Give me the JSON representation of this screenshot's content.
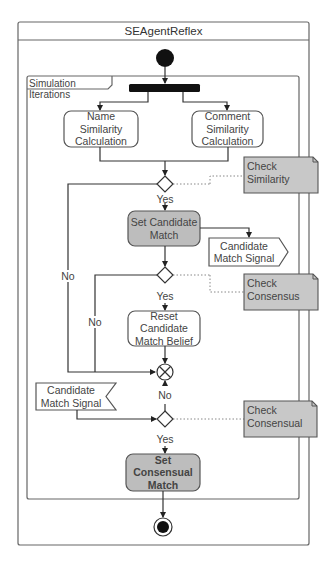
{
  "diagram": {
    "type": "uml-activity",
    "outer_frame": {
      "title": "SEAgentReflex"
    },
    "inner_frame": {
      "label": "Simulation Iterations"
    },
    "nodes": {
      "initial": {
        "kind": "initial"
      },
      "fork": {
        "kind": "fork"
      },
      "name_similarity": {
        "kind": "action",
        "label": "Name Similarity Calculation"
      },
      "comment_similarity": {
        "kind": "action",
        "label": "Comment Similarity Calculation"
      },
      "decision_similarity": {
        "kind": "decision"
      },
      "set_candidate_match": {
        "kind": "action",
        "label": "Set Candidate Match",
        "fill": "#bdbdbd"
      },
      "send_signal": {
        "kind": "send-signal",
        "label": "Candidate Match Signal"
      },
      "decision_consensus": {
        "kind": "decision"
      },
      "reset_candidate": {
        "kind": "action",
        "label": "Reset Candidate Match Belief"
      },
      "merge": {
        "kind": "merge"
      },
      "accept_signal": {
        "kind": "accept-signal",
        "label": "Candidate Match Signal"
      },
      "decision_consensual": {
        "kind": "decision"
      },
      "set_consensual_match": {
        "kind": "action",
        "label": "Set Consensual Match",
        "fill": "#bdbdbd",
        "bold": true
      },
      "final": {
        "kind": "final"
      }
    },
    "notes": {
      "check_similarity": {
        "label": "Check Similarity",
        "fill": "#c8c8c8"
      },
      "check_consensus": {
        "label": "Check Consensus",
        "fill": "#c8c8c8"
      },
      "check_consensual": {
        "label": "Check Consensual",
        "fill": "#c8c8c8"
      }
    },
    "edge_labels": {
      "yes_1": "Yes",
      "no_1": "No",
      "yes_2": "Yes",
      "no_2": "No",
      "no_3": "No",
      "yes_3": "Yes"
    },
    "colors": {
      "stroke": "#555555",
      "action_fill": "#ffffff",
      "highlight_fill": "#bdbdbd",
      "note_fill": "#c8c8c8",
      "dark": "#111111"
    }
  }
}
